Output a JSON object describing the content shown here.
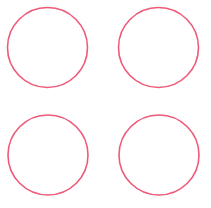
{
  "canvas": {
    "width": 211,
    "height": 208,
    "background": "#ffffff"
  },
  "style": {
    "stroke": "#ee5a78",
    "stroke_width": 1.6,
    "fill": "none"
  },
  "circles": [
    {
      "cx": 47.5,
      "cy": 47.5,
      "r": 40
    },
    {
      "cx": 158.5,
      "cy": 47.5,
      "r": 40
    },
    {
      "cx": 48,
      "cy": 155,
      "r": 40
    },
    {
      "cx": 159,
      "cy": 155,
      "r": 40
    }
  ]
}
